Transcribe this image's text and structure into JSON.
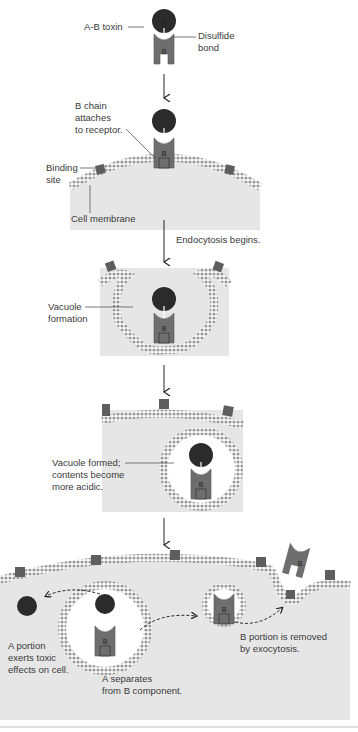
{
  "colors": {
    "toxin_a": "#2b2b2b",
    "toxin_b": "#6e6e6e",
    "receptor": "#5e5e5e",
    "cytoplasm": "#e6e6e6",
    "membrane": "#b0b0b0",
    "text": "#3a3a3a",
    "arrow": "#222222"
  },
  "labels": {
    "ab_toxin": "A-B toxin",
    "disulfide_bond": "Disulfide\nbond",
    "b_chain_attaches": "B chain\nattaches\nto receptor.",
    "binding_site": "Binding\nsite",
    "cell_membrane": "Cell membrane",
    "endocytosis_begins": "Endocytosis begins.",
    "vacuole_formation": "Vacuole\nformation",
    "vacuole_formed": "Vacuole formed;\ncontents become\nmore acidic.",
    "a_portion_effects": "A portion\nexerts toxic\neffects on cell.",
    "a_separates": "A separates\nfrom B component.",
    "b_portion_removed": "B portion is removed\nby exocytosis."
  },
  "chain_letters": {
    "a": "A",
    "b": "B"
  },
  "steps": [
    "A-B toxin",
    "B chain attaches to receptor.",
    "Endocytosis begins. Vacuole formation",
    "Vacuole formed; contents become more acidic.",
    "A separates from B component."
  ]
}
